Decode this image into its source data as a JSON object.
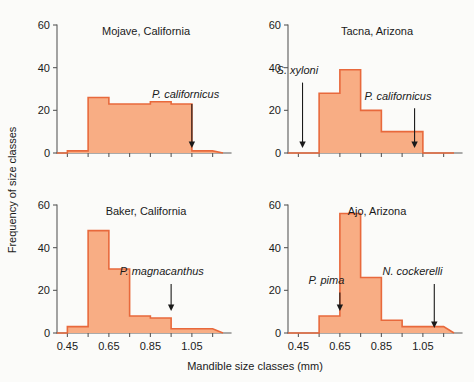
{
  "figure": {
    "xlabel": "Mandible size classes (mm)",
    "ylabel": "Frequency of size classes",
    "bar_fill": "#f8ad84",
    "bar_stroke": "#e8693c",
    "axis_color": "#5a5a5a",
    "background": "#fbfbf9"
  },
  "axes": {
    "x_ticks": [
      0.45,
      0.55,
      0.65,
      0.75,
      0.85,
      0.95,
      1.05,
      1.15
    ],
    "x_tick_labels": [
      "0.45",
      "",
      "0.65",
      "",
      "0.85",
      "",
      "1.05",
      ""
    ],
    "x_labeled": [
      "0.45",
      "0.65",
      "0.85",
      "1.05"
    ],
    "y_ticks": [
      0,
      20,
      40,
      60
    ],
    "y_tick_labels": [
      "0",
      "20",
      "40",
      "60"
    ],
    "xlim": [
      0.4,
      1.2
    ],
    "ylim": [
      0,
      62
    ]
  },
  "chart_data": {
    "type": "bar",
    "title": "",
    "xlabel": "Mandible size classes (mm)",
    "ylabel": "Frequency of size classes",
    "xlim": [
      0.4,
      1.2
    ],
    "ylim": [
      0,
      62
    ],
    "grid": false,
    "legend": "none",
    "bin_edges": [
      0.45,
      0.55,
      0.65,
      0.75,
      0.85,
      0.95,
      1.05,
      1.15
    ],
    "panels": [
      {
        "id": "mojave",
        "title": "Mojave, California",
        "position": "top-left",
        "categories": [
          "0.45-0.55",
          "0.55-0.65",
          "0.65-0.75",
          "0.75-0.85",
          "0.85-0.95",
          "0.95-1.05",
          "1.05-1.15"
        ],
        "values": [
          1,
          26,
          23,
          23,
          24,
          23,
          1
        ],
        "annotations": [
          {
            "label": "P. californicus",
            "x": 1.05,
            "label_x": 1.02,
            "label_y": 26,
            "arrow_from_y": 23,
            "arrow_to_y": 3
          }
        ]
      },
      {
        "id": "tacna",
        "title": "Tacna, Arizona",
        "position": "top-right",
        "categories": [
          "0.45-0.55",
          "0.55-0.65",
          "0.65-0.75",
          "0.75-0.85",
          "0.85-0.95",
          "0.95-1.05",
          "1.05-1.15"
        ],
        "values": [
          0,
          28,
          39,
          20,
          10,
          10,
          0
        ],
        "annotations": [
          {
            "label": "S. xyloni",
            "x": 0.47,
            "label_x": 0.445,
            "label_y": 37,
            "arrow_from_y": 33,
            "arrow_to_y": 3
          },
          {
            "label": "P. californicus",
            "x": 1.01,
            "label_x": 0.93,
            "label_y": 25,
            "arrow_from_y": 21,
            "arrow_to_y": 3
          }
        ]
      },
      {
        "id": "baker",
        "title": "Baker, California",
        "position": "bottom-left",
        "categories": [
          "0.45-0.55",
          "0.55-0.65",
          "0.65-0.75",
          "0.75-0.85",
          "0.85-0.95",
          "0.95-1.05",
          "1.05-1.15"
        ],
        "values": [
          3,
          48,
          30,
          8,
          7,
          2,
          2
        ],
        "annotations": [
          {
            "label": "P. magnacanthus",
            "x": 0.95,
            "label_x": 0.905,
            "label_y": 27,
            "arrow_from_y": 23,
            "arrow_to_y": 11
          }
        ]
      },
      {
        "id": "ajo",
        "title": "Ajo, Arizona",
        "position": "bottom-right",
        "categories": [
          "0.45-0.55",
          "0.55-0.65",
          "0.65-0.75",
          "0.75-0.85",
          "0.85-0.95",
          "0.95-1.05",
          "1.05-1.15"
        ],
        "values": [
          0,
          8,
          56,
          26,
          6,
          3,
          3
        ],
        "annotations": [
          {
            "label": "P. pima",
            "x": 0.65,
            "label_x": 0.585,
            "label_y": 23,
            "arrow_from_y": 19,
            "arrow_to_y": 11
          },
          {
            "label": "N. cockerelli",
            "x": 1.105,
            "label_x": 1.0,
            "label_y": 27,
            "arrow_from_y": 23,
            "arrow_to_y": 3
          }
        ]
      }
    ]
  }
}
